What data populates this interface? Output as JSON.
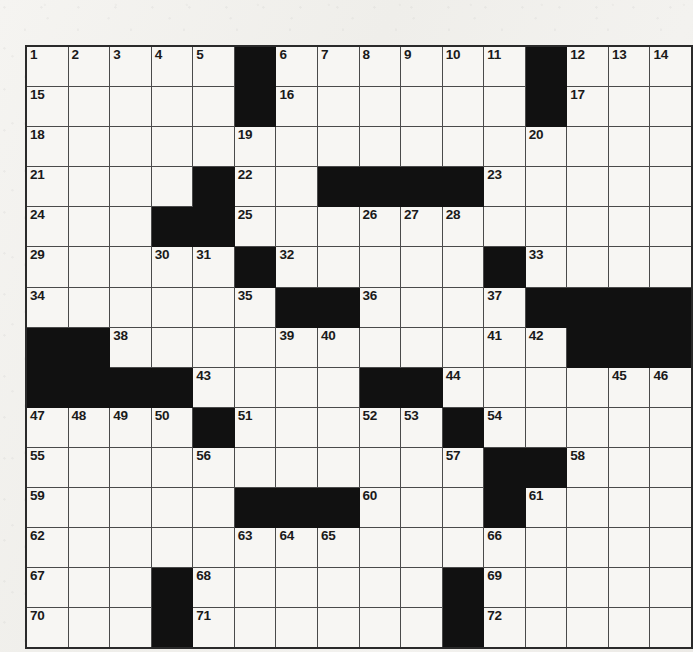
{
  "puzzle": {
    "title": "Crossword Grid",
    "rows": 15,
    "columns": 15,
    "cell_size_px": 42.7,
    "colors": {
      "page_background": "#f2f1ee",
      "cell_background": "#f7f6f3",
      "block_color": "#111111",
      "grid_line_color": "#4a4a4a",
      "outer_border_color": "#2a2a2a",
      "number_color": "#1a1a1a"
    },
    "legend": {
      "open_cell": "open",
      "blocked_cell": "block"
    },
    "numbered_cells": [
      1,
      2,
      3,
      4,
      5,
      6,
      7,
      8,
      9,
      10,
      11,
      12,
      13,
      14,
      15,
      16,
      17,
      18,
      19,
      20,
      21,
      22,
      23,
      24,
      25,
      26,
      27,
      28,
      29,
      30,
      31,
      32,
      33,
      34,
      35,
      36,
      37,
      38,
      39,
      40,
      41,
      42,
      43,
      44,
      45,
      46,
      47,
      48,
      49,
      50,
      51,
      52,
      53,
      54,
      55,
      56,
      57,
      58,
      59,
      60,
      61,
      62,
      63,
      64,
      65,
      66,
      67,
      68,
      69,
      70,
      71,
      72
    ],
    "total_clue_numbers": 72,
    "grid": [
      [
        {
          "type": "open",
          "number": "1"
        },
        {
          "type": "open",
          "number": "2"
        },
        {
          "type": "open",
          "number": "3"
        },
        {
          "type": "open",
          "number": "4"
        },
        {
          "type": "open",
          "number": "5"
        },
        {
          "type": "block",
          "number": ""
        },
        {
          "type": "open",
          "number": "6"
        },
        {
          "type": "open",
          "number": "7"
        },
        {
          "type": "open",
          "number": "8"
        },
        {
          "type": "open",
          "number": "9"
        },
        {
          "type": "open",
          "number": "10"
        },
        {
          "type": "open",
          "number": "11"
        },
        {
          "type": "block",
          "number": ""
        },
        {
          "type": "open",
          "number": "12"
        },
        {
          "type": "open",
          "number": "13"
        },
        {
          "type": "open",
          "number": "14"
        }
      ],
      [
        {
          "type": "open",
          "number": "15"
        },
        {
          "type": "open",
          "number": ""
        },
        {
          "type": "open",
          "number": ""
        },
        {
          "type": "open",
          "number": ""
        },
        {
          "type": "open",
          "number": ""
        },
        {
          "type": "block",
          "number": ""
        },
        {
          "type": "open",
          "number": "16"
        },
        {
          "type": "open",
          "number": ""
        },
        {
          "type": "open",
          "number": ""
        },
        {
          "type": "open",
          "number": ""
        },
        {
          "type": "open",
          "number": ""
        },
        {
          "type": "open",
          "number": ""
        },
        {
          "type": "block",
          "number": ""
        },
        {
          "type": "open",
          "number": "17"
        },
        {
          "type": "open",
          "number": ""
        },
        {
          "type": "open",
          "number": ""
        }
      ],
      [
        {
          "type": "open",
          "number": "18"
        },
        {
          "type": "open",
          "number": ""
        },
        {
          "type": "open",
          "number": ""
        },
        {
          "type": "open",
          "number": ""
        },
        {
          "type": "open",
          "number": ""
        },
        {
          "type": "open",
          "number": "19"
        },
        {
          "type": "open",
          "number": ""
        },
        {
          "type": "open",
          "number": ""
        },
        {
          "type": "open",
          "number": ""
        },
        {
          "type": "open",
          "number": ""
        },
        {
          "type": "open",
          "number": ""
        },
        {
          "type": "open",
          "number": ""
        },
        {
          "type": "open",
          "number": "20"
        },
        {
          "type": "open",
          "number": ""
        },
        {
          "type": "open",
          "number": ""
        },
        {
          "type": "open",
          "number": ""
        }
      ],
      [
        {
          "type": "open",
          "number": "21"
        },
        {
          "type": "open",
          "number": ""
        },
        {
          "type": "open",
          "number": ""
        },
        {
          "type": "open",
          "number": ""
        },
        {
          "type": "block",
          "number": ""
        },
        {
          "type": "open",
          "number": "22"
        },
        {
          "type": "open",
          "number": ""
        },
        {
          "type": "block",
          "number": ""
        },
        {
          "type": "block",
          "number": ""
        },
        {
          "type": "block",
          "number": ""
        },
        {
          "type": "block",
          "number": ""
        },
        {
          "type": "open",
          "number": "23"
        },
        {
          "type": "open",
          "number": ""
        },
        {
          "type": "open",
          "number": ""
        },
        {
          "type": "open",
          "number": ""
        },
        {
          "type": "open",
          "number": ""
        }
      ],
      [
        {
          "type": "open",
          "number": "24"
        },
        {
          "type": "open",
          "number": ""
        },
        {
          "type": "open",
          "number": ""
        },
        {
          "type": "block",
          "number": ""
        },
        {
          "type": "block",
          "number": ""
        },
        {
          "type": "open",
          "number": "25"
        },
        {
          "type": "open",
          "number": ""
        },
        {
          "type": "open",
          "number": ""
        },
        {
          "type": "open",
          "number": "26"
        },
        {
          "type": "open",
          "number": "27"
        },
        {
          "type": "open",
          "number": "28"
        },
        {
          "type": "open",
          "number": ""
        },
        {
          "type": "open",
          "number": ""
        },
        {
          "type": "open",
          "number": ""
        },
        {
          "type": "open",
          "number": ""
        },
        {
          "type": "open",
          "number": ""
        }
      ],
      [
        {
          "type": "open",
          "number": "29"
        },
        {
          "type": "open",
          "number": ""
        },
        {
          "type": "open",
          "number": ""
        },
        {
          "type": "open",
          "number": "30"
        },
        {
          "type": "open",
          "number": "31"
        },
        {
          "type": "block",
          "number": ""
        },
        {
          "type": "open",
          "number": "32"
        },
        {
          "type": "open",
          "number": ""
        },
        {
          "type": "open",
          "number": ""
        },
        {
          "type": "open",
          "number": ""
        },
        {
          "type": "open",
          "number": ""
        },
        {
          "type": "block",
          "number": ""
        },
        {
          "type": "open",
          "number": "33"
        },
        {
          "type": "open",
          "number": ""
        },
        {
          "type": "open",
          "number": ""
        },
        {
          "type": "open",
          "number": ""
        }
      ],
      [
        {
          "type": "open",
          "number": "34"
        },
        {
          "type": "open",
          "number": ""
        },
        {
          "type": "open",
          "number": ""
        },
        {
          "type": "open",
          "number": ""
        },
        {
          "type": "open",
          "number": ""
        },
        {
          "type": "open",
          "number": "35"
        },
        {
          "type": "block",
          "number": ""
        },
        {
          "type": "block",
          "number": ""
        },
        {
          "type": "open",
          "number": "36"
        },
        {
          "type": "open",
          "number": ""
        },
        {
          "type": "open",
          "number": ""
        },
        {
          "type": "open",
          "number": "37"
        },
        {
          "type": "block",
          "number": ""
        },
        {
          "type": "block",
          "number": ""
        },
        {
          "type": "block",
          "number": ""
        },
        {
          "type": "block",
          "number": ""
        }
      ],
      [
        {
          "type": "block",
          "number": ""
        },
        {
          "type": "block",
          "number": ""
        },
        {
          "type": "open",
          "number": "38"
        },
        {
          "type": "open",
          "number": ""
        },
        {
          "type": "open",
          "number": ""
        },
        {
          "type": "open",
          "number": ""
        },
        {
          "type": "open",
          "number": "39"
        },
        {
          "type": "open",
          "number": "40"
        },
        {
          "type": "open",
          "number": ""
        },
        {
          "type": "open",
          "number": ""
        },
        {
          "type": "open",
          "number": ""
        },
        {
          "type": "open",
          "number": "41"
        },
        {
          "type": "open",
          "number": "42"
        },
        {
          "type": "block",
          "number": ""
        },
        {
          "type": "block",
          "number": ""
        },
        {
          "type": "block",
          "number": ""
        }
      ],
      [
        {
          "type": "block",
          "number": ""
        },
        {
          "type": "block",
          "number": ""
        },
        {
          "type": "block",
          "number": ""
        },
        {
          "type": "block",
          "number": ""
        },
        {
          "type": "open",
          "number": "43"
        },
        {
          "type": "open",
          "number": ""
        },
        {
          "type": "open",
          "number": ""
        },
        {
          "type": "open",
          "number": ""
        },
        {
          "type": "block",
          "number": ""
        },
        {
          "type": "block",
          "number": ""
        },
        {
          "type": "open",
          "number": "44"
        },
        {
          "type": "open",
          "number": ""
        },
        {
          "type": "open",
          "number": ""
        },
        {
          "type": "open",
          "number": ""
        },
        {
          "type": "open",
          "number": "45"
        },
        {
          "type": "open",
          "number": "46"
        }
      ],
      [
        {
          "type": "open",
          "number": "47"
        },
        {
          "type": "open",
          "number": "48"
        },
        {
          "type": "open",
          "number": "49"
        },
        {
          "type": "open",
          "number": "50"
        },
        {
          "type": "block",
          "number": ""
        },
        {
          "type": "open",
          "number": "51"
        },
        {
          "type": "open",
          "number": ""
        },
        {
          "type": "open",
          "number": ""
        },
        {
          "type": "open",
          "number": "52"
        },
        {
          "type": "open",
          "number": "53"
        },
        {
          "type": "block",
          "number": ""
        },
        {
          "type": "open",
          "number": "54"
        },
        {
          "type": "open",
          "number": ""
        },
        {
          "type": "open",
          "number": ""
        },
        {
          "type": "open",
          "number": ""
        },
        {
          "type": "open",
          "number": ""
        }
      ],
      [
        {
          "type": "open",
          "number": "55"
        },
        {
          "type": "open",
          "number": ""
        },
        {
          "type": "open",
          "number": ""
        },
        {
          "type": "open",
          "number": ""
        },
        {
          "type": "open",
          "number": "56"
        },
        {
          "type": "open",
          "number": ""
        },
        {
          "type": "open",
          "number": ""
        },
        {
          "type": "open",
          "number": ""
        },
        {
          "type": "open",
          "number": ""
        },
        {
          "type": "open",
          "number": ""
        },
        {
          "type": "open",
          "number": "57"
        },
        {
          "type": "block",
          "number": ""
        },
        {
          "type": "block",
          "number": ""
        },
        {
          "type": "open",
          "number": "58"
        },
        {
          "type": "open",
          "number": ""
        },
        {
          "type": "open",
          "number": ""
        }
      ],
      [
        {
          "type": "open",
          "number": "59"
        },
        {
          "type": "open",
          "number": ""
        },
        {
          "type": "open",
          "number": ""
        },
        {
          "type": "open",
          "number": ""
        },
        {
          "type": "open",
          "number": ""
        },
        {
          "type": "block",
          "number": ""
        },
        {
          "type": "block",
          "number": ""
        },
        {
          "type": "block",
          "number": ""
        },
        {
          "type": "open",
          "number": "60"
        },
        {
          "type": "open",
          "number": ""
        },
        {
          "type": "open",
          "number": ""
        },
        {
          "type": "block",
          "number": ""
        },
        {
          "type": "open",
          "number": "61"
        },
        {
          "type": "open",
          "number": ""
        },
        {
          "type": "open",
          "number": ""
        },
        {
          "type": "open",
          "number": ""
        }
      ],
      [
        {
          "type": "open",
          "number": "62"
        },
        {
          "type": "open",
          "number": ""
        },
        {
          "type": "open",
          "number": ""
        },
        {
          "type": "open",
          "number": ""
        },
        {
          "type": "open",
          "number": ""
        },
        {
          "type": "open",
          "number": "63"
        },
        {
          "type": "open",
          "number": "64"
        },
        {
          "type": "open",
          "number": "65"
        },
        {
          "type": "open",
          "number": ""
        },
        {
          "type": "open",
          "number": ""
        },
        {
          "type": "open",
          "number": ""
        },
        {
          "type": "open",
          "number": "66"
        },
        {
          "type": "open",
          "number": ""
        },
        {
          "type": "open",
          "number": ""
        },
        {
          "type": "open",
          "number": ""
        },
        {
          "type": "open",
          "number": ""
        }
      ],
      [
        {
          "type": "open",
          "number": "67"
        },
        {
          "type": "open",
          "number": ""
        },
        {
          "type": "open",
          "number": ""
        },
        {
          "type": "block",
          "number": ""
        },
        {
          "type": "open",
          "number": "68"
        },
        {
          "type": "open",
          "number": ""
        },
        {
          "type": "open",
          "number": ""
        },
        {
          "type": "open",
          "number": ""
        },
        {
          "type": "open",
          "number": ""
        },
        {
          "type": "open",
          "number": ""
        },
        {
          "type": "block",
          "number": ""
        },
        {
          "type": "open",
          "number": "69"
        },
        {
          "type": "open",
          "number": ""
        },
        {
          "type": "open",
          "number": ""
        },
        {
          "type": "open",
          "number": ""
        },
        {
          "type": "open",
          "number": ""
        }
      ],
      [
        {
          "type": "open",
          "number": "70"
        },
        {
          "type": "open",
          "number": ""
        },
        {
          "type": "open",
          "number": ""
        },
        {
          "type": "block",
          "number": ""
        },
        {
          "type": "open",
          "number": "71"
        },
        {
          "type": "open",
          "number": ""
        },
        {
          "type": "open",
          "number": ""
        },
        {
          "type": "open",
          "number": ""
        },
        {
          "type": "open",
          "number": ""
        },
        {
          "type": "open",
          "number": ""
        },
        {
          "type": "block",
          "number": ""
        },
        {
          "type": "open",
          "number": "72"
        },
        {
          "type": "open",
          "number": ""
        },
        {
          "type": "open",
          "number": ""
        },
        {
          "type": "open",
          "number": ""
        },
        {
          "type": "open",
          "number": ""
        }
      ]
    ]
  }
}
